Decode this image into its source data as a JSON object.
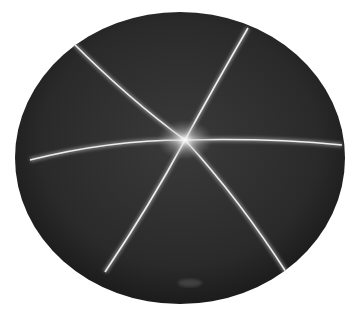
{
  "image": {
    "subject": "Star sapphire cabochon with six-rayed asterism",
    "background": "#ffffff",
    "stone_color": "#2a2a2a",
    "ray_color": "#e8e8e8"
  },
  "stone": {
    "cx": 180,
    "cy": 158,
    "rx": 165,
    "ry": 146
  },
  "star_center": {
    "x": 185,
    "y": 140
  },
  "rays": [
    {
      "x1": 248,
      "y1": 28,
      "x2": 105,
      "y2": 272
    },
    {
      "x1": 72,
      "y1": 42,
      "x2": 288,
      "y2": 275
    },
    {
      "x1": 30,
      "y1": 160,
      "x2": 342,
      "y2": 145
    }
  ]
}
